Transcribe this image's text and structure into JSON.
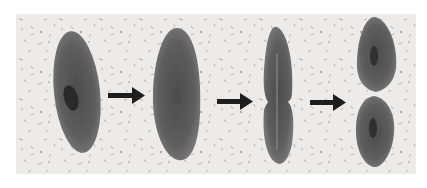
{
  "figure": {
    "background_color": "#ecebea",
    "cell_color": "#5a5a5a",
    "arrow_color": "#1e1e1e",
    "stages": [
      {
        "label": "stage-1",
        "shape": "single elongated cell with visible nucleus"
      },
      {
        "label": "stage-2",
        "shape": "enlarged cell"
      },
      {
        "label": "stage-3",
        "shape": "cell constricting in middle"
      },
      {
        "label": "stage-4",
        "shape": "two daughter cells separating"
      }
    ],
    "arrows": [
      "arrow-right",
      "arrow-right",
      "arrow-right"
    ]
  },
  "caption": {
    "text": ""
  }
}
